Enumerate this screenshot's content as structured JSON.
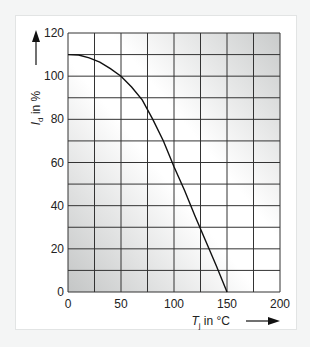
{
  "chart_data": {
    "type": "line",
    "title": "",
    "xlabel": "T_j in °C",
    "ylabel": "I_d in %",
    "xlabel_main": "T",
    "xlabel_sub": "j",
    "xlabel_unit": " in °C",
    "ylabel_main": "I",
    "ylabel_sub": "d",
    "ylabel_unit": " in %",
    "xlim": [
      0,
      200
    ],
    "ylim": [
      0,
      120
    ],
    "x_ticks": [
      "0",
      "50",
      "100",
      "150",
      "200"
    ],
    "y_ticks": [
      "0",
      "20",
      "40",
      "60",
      "80",
      "100",
      "120"
    ],
    "grid": true,
    "x_grid_step": 25,
    "y_grid_step": 10,
    "legend": null,
    "series": [
      {
        "name": "Drain current derating",
        "x": [
          0,
          10,
          20,
          30,
          40,
          50,
          60,
          70,
          80,
          90,
          100,
          110,
          120,
          130,
          140,
          150
        ],
        "values": [
          110,
          109.8,
          108.5,
          106.5,
          103.5,
          100,
          95,
          89,
          80,
          70,
          58,
          47,
          35,
          23.5,
          12,
          0
        ]
      }
    ]
  }
}
